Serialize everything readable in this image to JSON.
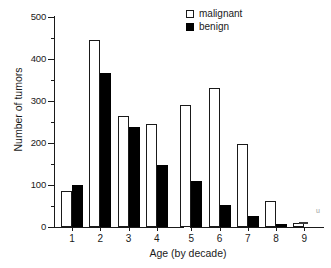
{
  "chart_data": {
    "type": "bar",
    "title": "",
    "xlabel": "Age (by decade)",
    "ylabel": "Number of tumors",
    "categories": [
      "1",
      "2",
      "3",
      "4",
      "5",
      "6",
      "7",
      "8",
      "9"
    ],
    "series": [
      {
        "name": "malignant",
        "color": "#ffffff",
        "values": [
          86,
          445,
          265,
          245,
          290,
          331,
          197,
          62,
          10
        ]
      },
      {
        "name": "benign",
        "color": "#000000",
        "values": [
          99,
          367,
          237,
          147,
          109,
          52,
          27,
          6,
          0
        ]
      }
    ],
    "ylim": [
      0,
      500
    ],
    "ytick_labels": [
      "0",
      "100",
      "200",
      "300",
      "400",
      "500"
    ],
    "ytick_values": [
      0,
      100,
      200,
      300,
      400,
      500
    ],
    "yminor_values": [
      50,
      150,
      250,
      350,
      450
    ],
    "grid": false,
    "legend_position": "top-right"
  },
  "legend": {
    "entries": [
      {
        "label": "malignant",
        "swatch": "open-square"
      },
      {
        "label": "benign",
        "swatch": "filled-square"
      }
    ]
  },
  "artifact": {
    "mark": "u"
  }
}
